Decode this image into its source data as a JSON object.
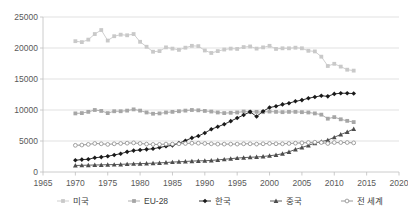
{
  "chart_data": {
    "type": "line",
    "title": "",
    "subtitle": "",
    "xlabel": "",
    "ylabel": "",
    "xlim": [
      1965,
      2020
    ],
    "ylim": [
      0,
      25000
    ],
    "xticks": [
      "1965",
      "1970",
      "1975",
      "1980",
      "1985",
      "1990",
      "1995",
      "2000",
      "2005",
      "2010",
      "2015",
      "2020"
    ],
    "yticks": [
      "0",
      "5000",
      "10000",
      "15000",
      "20000",
      "25000"
    ],
    "grid": true,
    "legend_position": "bottom",
    "x": [
      1970,
      1971,
      1972,
      1973,
      1974,
      1975,
      1976,
      1977,
      1978,
      1979,
      1980,
      1981,
      1982,
      1983,
      1984,
      1985,
      1986,
      1987,
      1988,
      1989,
      1990,
      1991,
      1992,
      1993,
      1994,
      1995,
      1996,
      1997,
      1998,
      1999,
      2000,
      2001,
      2002,
      2003,
      2004,
      2005,
      2006,
      2007,
      2008,
      2009,
      2010,
      2011,
      2012,
      2013
    ],
    "series": [
      {
        "name": "미국",
        "color": "#c9c9c9",
        "marker": "square",
        "values": [
          21100,
          20950,
          21350,
          22250,
          22900,
          21200,
          21900,
          22150,
          22050,
          22250,
          21000,
          20200,
          19400,
          19500,
          20100,
          19900,
          19700,
          20050,
          20350,
          20300,
          19600,
          19200,
          19500,
          19750,
          19900,
          19850,
          20150,
          20250,
          19900,
          20100,
          20350,
          19850,
          19950,
          19950,
          20050,
          19950,
          19550,
          19450,
          18600,
          17100,
          17450,
          17000,
          16500,
          16350
        ]
      },
      {
        "name": "EU-28",
        "color": "#a6a6a6",
        "marker": "square",
        "values": [
          9450,
          9500,
          9700,
          10000,
          9850,
          9500,
          9800,
          9800,
          9900,
          10100,
          9900,
          9600,
          9400,
          9450,
          9600,
          9700,
          9800,
          9900,
          10000,
          9950,
          9850,
          9750,
          9600,
          9500,
          9550,
          9600,
          9750,
          9700,
          9700,
          9650,
          9750,
          9700,
          9650,
          9700,
          9700,
          9650,
          9600,
          9450,
          9250,
          8600,
          8850,
          8500,
          8250,
          8050
        ]
      },
      {
        "name": "한국",
        "color": "#1a1a1a",
        "marker": "diamond",
        "values": [
          1900,
          2000,
          2050,
          2300,
          2400,
          2550,
          2750,
          2950,
          3250,
          3450,
          3550,
          3650,
          3750,
          3950,
          4150,
          4300,
          4650,
          5050,
          5500,
          5800,
          6300,
          6900,
          7300,
          7700,
          8200,
          8700,
          9200,
          9700,
          8950,
          9800,
          10400,
          10600,
          10900,
          11100,
          11400,
          11600,
          11900,
          12100,
          12300,
          12200,
          12600,
          12700,
          12700,
          12650
        ]
      },
      {
        "name": "중국",
        "color": "#4d4d4d",
        "marker": "triangle",
        "values": [
          1050,
          1080,
          1100,
          1130,
          1150,
          1180,
          1200,
          1230,
          1280,
          1320,
          1350,
          1380,
          1420,
          1470,
          1530,
          1600,
          1650,
          1700,
          1760,
          1800,
          1820,
          1870,
          1950,
          2050,
          2150,
          2250,
          2320,
          2380,
          2420,
          2500,
          2620,
          2750,
          2950,
          3250,
          3650,
          3950,
          4300,
          4650,
          4900,
          5150,
          5600,
          6050,
          6450,
          6950
        ]
      },
      {
        "name": "전 세계",
        "color": "#8c8c8c",
        "marker": "circle-open",
        "values": [
          4300,
          4350,
          4450,
          4600,
          4550,
          4450,
          4550,
          4600,
          4650,
          4700,
          4600,
          4500,
          4450,
          4450,
          4500,
          4500,
          4550,
          4600,
          4650,
          4650,
          4600,
          4550,
          4500,
          4500,
          4500,
          4500,
          4550,
          4550,
          4500,
          4550,
          4600,
          4550,
          4550,
          4600,
          4650,
          4700,
          4750,
          4800,
          4750,
          4600,
          4750,
          4750,
          4750,
          4700
        ]
      }
    ]
  },
  "legend": {
    "items": [
      {
        "label": "미국",
        "color": "#c9c9c9",
        "marker": "square"
      },
      {
        "label": "EU-28",
        "color": "#a6a6a6",
        "marker": "square"
      },
      {
        "label": "한국",
        "color": "#1a1a1a",
        "marker": "diamond"
      },
      {
        "label": "중국",
        "color": "#4d4d4d",
        "marker": "triangle"
      },
      {
        "label": "전 세계",
        "color": "#8c8c8c",
        "marker": "circle-open"
      }
    ]
  }
}
